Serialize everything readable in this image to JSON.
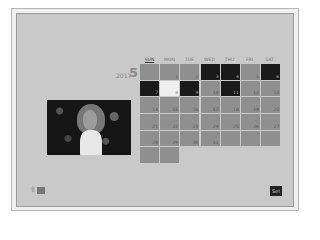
{
  "header": {
    "year": "2017",
    "month": "5"
  },
  "weekdays": [
    "SUN",
    "MON",
    "TUE",
    "WED",
    "THU",
    "FRI",
    "SAT"
  ],
  "calendar": {
    "cells": [
      {
        "day": "",
        "type": "normal"
      },
      {
        "day": "1",
        "type": "normal"
      },
      {
        "day": "2",
        "type": "normal"
      },
      {
        "day": "3",
        "type": "dark"
      },
      {
        "day": "4",
        "type": "dark"
      },
      {
        "day": "5",
        "type": "normal"
      },
      {
        "day": "6",
        "type": "dark"
      },
      {
        "day": "7",
        "type": "dark"
      },
      {
        "day": "8",
        "type": "selected"
      },
      {
        "day": "9",
        "type": "dark"
      },
      {
        "day": "10",
        "type": "normal"
      },
      {
        "day": "11",
        "type": "dark"
      },
      {
        "day": "12",
        "type": "normal"
      },
      {
        "day": "13",
        "type": "normal"
      },
      {
        "day": "14",
        "type": "normal"
      },
      {
        "day": "15",
        "type": "normal"
      },
      {
        "day": "16",
        "type": "normal"
      },
      {
        "day": "17",
        "type": "normal"
      },
      {
        "day": "18",
        "type": "normal"
      },
      {
        "day": "19",
        "type": "normal"
      },
      {
        "day": "20",
        "type": "normal"
      },
      {
        "day": "21",
        "type": "normal"
      },
      {
        "day": "22",
        "type": "normal"
      },
      {
        "day": "23",
        "type": "normal"
      },
      {
        "day": "24",
        "type": "normal"
      },
      {
        "day": "25",
        "type": "normal"
      },
      {
        "day": "26",
        "type": "normal"
      },
      {
        "day": "27",
        "type": "normal"
      },
      {
        "day": "28",
        "type": "normal"
      },
      {
        "day": "29",
        "type": "normal"
      },
      {
        "day": "30",
        "type": "normal"
      },
      {
        "day": "31",
        "type": "normal"
      },
      {
        "day": "",
        "type": "normal"
      },
      {
        "day": "",
        "type": "normal"
      },
      {
        "day": "",
        "type": "normal"
      },
      {
        "day": "",
        "type": "normal"
      },
      {
        "day": "",
        "type": "normal"
      }
    ]
  },
  "photo": {
    "icon": "thumbnail-image"
  },
  "footer": {
    "playback_icon": "playback-icon",
    "set_label": "Set"
  }
}
